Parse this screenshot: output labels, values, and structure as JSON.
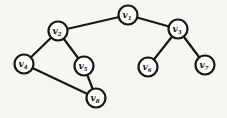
{
  "figure": {
    "background_color": "#f6f6f3",
    "ink_color": "#161616",
    "node_fill": "#fdfdfb",
    "node_radius": 9.5,
    "stroke_width": 2.2
  },
  "diagram": {
    "type": "graph",
    "nodes": [
      {
        "id": "v1",
        "label": "v",
        "sub": "1",
        "x": 128,
        "y": 15
      },
      {
        "id": "v2",
        "label": "v",
        "sub": "2",
        "x": 58,
        "y": 31
      },
      {
        "id": "v3",
        "label": "v",
        "sub": "3",
        "x": 178,
        "y": 29
      },
      {
        "id": "v4",
        "label": "v",
        "sub": "4",
        "x": 24,
        "y": 64
      },
      {
        "id": "v5",
        "label": "v",
        "sub": "5",
        "x": 84,
        "y": 66
      },
      {
        "id": "v6",
        "label": "v",
        "sub": "6",
        "x": 148,
        "y": 67
      },
      {
        "id": "v7",
        "label": "v",
        "sub": "7",
        "x": 205,
        "y": 65
      },
      {
        "id": "v8",
        "label": "v",
        "sub": "8",
        "x": 96,
        "y": 98
      }
    ],
    "edges": [
      [
        "v1",
        "v2"
      ],
      [
        "v1",
        "v3"
      ],
      [
        "v2",
        "v4"
      ],
      [
        "v2",
        "v5"
      ],
      [
        "v3",
        "v6"
      ],
      [
        "v3",
        "v7"
      ],
      [
        "v4",
        "v8"
      ],
      [
        "v5",
        "v8"
      ]
    ]
  }
}
